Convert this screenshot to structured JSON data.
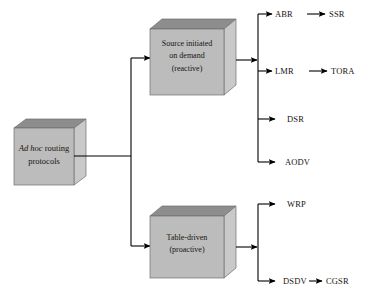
{
  "diagram": {
    "type": "tree",
    "colors": {
      "box_top": "#8d8d8d",
      "box_front": "#bcbcbc",
      "box_side": "#c9c9c9",
      "box_outline": "#6f6f6f",
      "connector": "#000000",
      "text": "#18140f",
      "background": "#ffffff"
    },
    "root": {
      "id": "root",
      "line1_italic": "Ad hoc",
      "line1_rest": " routing",
      "line2": "protocols",
      "full_text": "Ad hoc routing protocols"
    },
    "categories": [
      {
        "id": "reactive",
        "line1": "Source initiated",
        "line2": "on demand",
        "line3": "(reactive)",
        "full_text": "Source initiated on demand (reactive)"
      },
      {
        "id": "proactive",
        "line1": "Table-driven",
        "line2": "(proactive)",
        "line3": "",
        "full_text": "Table-driven (proactive)"
      }
    ],
    "protocols": {
      "reactive": [
        {
          "name": "ABR",
          "child": "SSR"
        },
        {
          "name": "LMR",
          "child": "TORA"
        },
        {
          "name": "DSR",
          "child": ""
        },
        {
          "name": "AODV",
          "child": ""
        }
      ],
      "proactive": [
        {
          "name": "WRP",
          "child": ""
        },
        {
          "name": "DSDV",
          "child": "CGSR"
        }
      ]
    }
  }
}
